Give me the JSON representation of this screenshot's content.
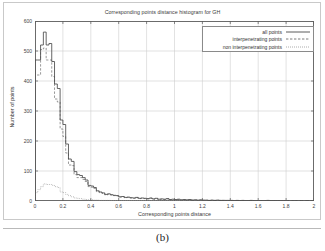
{
  "figure": {
    "caption": "(b)",
    "background": "#ffffff",
    "frame_color": "#c9c9c9"
  },
  "chart_data": {
    "type": "line",
    "title": "Corresponding points distance histogram for GH",
    "xlabel": "Corresponding points distance",
    "ylabel": "Number of points",
    "xlim": [
      0,
      2
    ],
    "ylim": [
      0,
      600
    ],
    "xticks": [
      0,
      0.2,
      0.4,
      0.6,
      0.8,
      1,
      1.2,
      1.4,
      1.6,
      1.8,
      2
    ],
    "xticklabels": [
      "0",
      "0.2",
      "0.4",
      "0.6",
      "0.8",
      "1",
      "1.2",
      "1.4",
      "1.6",
      "1.8",
      "2"
    ],
    "yticks": [
      0,
      100,
      200,
      300,
      400,
      500,
      600
    ],
    "yticklabels": [
      "0",
      "100",
      "200",
      "300",
      "400",
      "500",
      "600"
    ],
    "grid": true,
    "grid_color": "#cfcfcf",
    "legend_position": "top-right",
    "bin_width": 0.02,
    "x": [
      0.01,
      0.03,
      0.05,
      0.07,
      0.09,
      0.11,
      0.13,
      0.15,
      0.17,
      0.19,
      0.21,
      0.23,
      0.25,
      0.27,
      0.29,
      0.31,
      0.33,
      0.35,
      0.37,
      0.39,
      0.41,
      0.43,
      0.45,
      0.47,
      0.49,
      0.51,
      0.53,
      0.55,
      0.57,
      0.59,
      0.61,
      0.63,
      0.65,
      0.67,
      0.69,
      0.71,
      0.73,
      0.75,
      0.77,
      0.79,
      0.81,
      0.83,
      0.85,
      0.87,
      0.89,
      0.91,
      0.93,
      0.95,
      0.97,
      0.99,
      1.01,
      1.03,
      1.05,
      1.07,
      1.09,
      1.11,
      1.13,
      1.15,
      1.17,
      1.19,
      1.21,
      1.23,
      1.25,
      1.27,
      1.29,
      1.31,
      1.33,
      1.35,
      1.37,
      1.39,
      1.41,
      1.43,
      1.45,
      1.47,
      1.49,
      1.51,
      1.53,
      1.55,
      1.57,
      1.59,
      1.61,
      1.63,
      1.65,
      1.67,
      1.69,
      1.71,
      1.73,
      1.75,
      1.77,
      1.79,
      1.81,
      1.83,
      1.85,
      1.87,
      1.89,
      1.91,
      1.93,
      1.95,
      1.97,
      1.99
    ],
    "series": [
      {
        "name": "all points",
        "style": "solid",
        "color": "#4a4a4a",
        "values": [
          470,
          470,
          520,
          563,
          520,
          525,
          465,
          390,
          375,
          270,
          255,
          190,
          140,
          132,
          98,
          88,
          85,
          78,
          70,
          52,
          50,
          45,
          34,
          30,
          27,
          22,
          24,
          21,
          19,
          18,
          14,
          15,
          12,
          13,
          11,
          10,
          12,
          9,
          10,
          9,
          8,
          10,
          7,
          9,
          6,
          7,
          6,
          8,
          5,
          6,
          5,
          6,
          4,
          5,
          4,
          5,
          3,
          4,
          3,
          4,
          3,
          3,
          2,
          3,
          2,
          3,
          2,
          2,
          2,
          2,
          2,
          1,
          2,
          1,
          2,
          1,
          1,
          2,
          1,
          1,
          1,
          1,
          1,
          2,
          1,
          1,
          1,
          1,
          1,
          1,
          1,
          0,
          1,
          1,
          0,
          1,
          0,
          1,
          0,
          1
        ]
      },
      {
        "name": "interpenetrating points",
        "style": "dashed",
        "color": "#6e6e6e",
        "values": [
          420,
          420,
          505,
          510,
          470,
          470,
          415,
          340,
          330,
          240,
          215,
          160,
          120,
          118,
          88,
          78,
          78,
          72,
          65,
          48,
          46,
          42,
          31,
          28,
          25,
          20,
          22,
          20,
          18,
          17,
          13,
          14,
          11,
          12,
          10,
          9,
          11,
          8,
          9,
          8,
          7,
          9,
          6,
          8,
          5,
          6,
          5,
          7,
          4,
          5,
          4,
          5,
          3,
          4,
          3,
          4,
          3,
          3,
          2,
          3,
          2,
          2,
          2,
          2,
          2,
          2,
          2,
          2,
          1,
          2,
          1,
          1,
          1,
          1,
          1,
          1,
          1,
          1,
          1,
          1,
          1,
          1,
          1,
          1,
          1,
          1,
          1,
          1,
          1,
          1,
          1,
          0,
          1,
          1,
          0,
          1,
          0,
          1,
          0,
          1
        ]
      },
      {
        "name": "non interpenetrating points",
        "style": "dotted",
        "color": "#8c8c8c",
        "values": [
          28,
          38,
          48,
          57,
          55,
          55,
          52,
          48,
          45,
          30,
          28,
          22,
          18,
          14,
          10,
          9,
          8,
          6,
          5,
          4,
          4,
          3,
          3,
          2,
          2,
          2,
          2,
          1,
          1,
          1,
          1,
          1,
          1,
          1,
          1,
          1,
          1,
          1,
          1,
          1,
          1,
          1,
          1,
          1,
          1,
          1,
          1,
          1,
          1,
          1,
          1,
          1,
          1,
          1,
          1,
          1,
          0,
          1,
          1,
          1,
          1,
          1,
          0,
          1,
          0,
          1,
          0,
          0,
          1,
          0,
          1,
          0,
          1,
          0,
          1,
          0,
          0,
          1,
          0,
          0,
          0,
          0,
          0,
          1,
          0,
          0,
          0,
          0,
          0,
          0,
          0,
          0,
          0,
          0,
          0,
          0,
          0,
          0,
          0,
          0
        ]
      }
    ]
  }
}
